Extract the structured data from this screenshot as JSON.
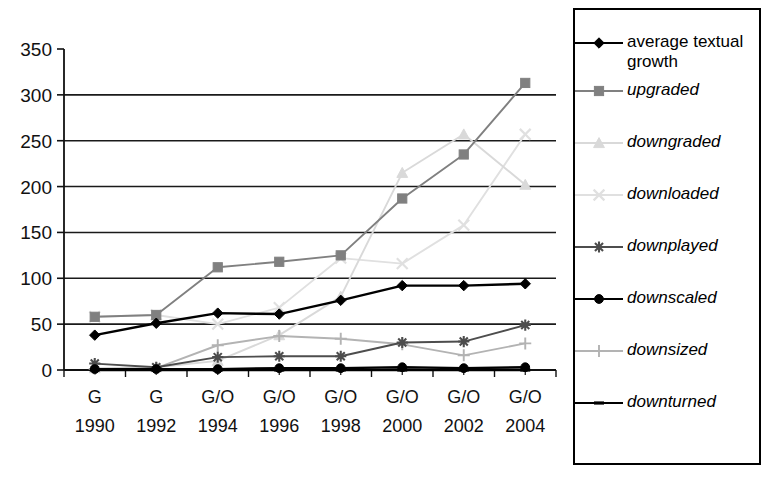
{
  "chart_data": {
    "type": "line",
    "title": "",
    "xlabel": "",
    "ylabel": "",
    "ylim": [
      0,
      350
    ],
    "ytick_step": 50,
    "yticks": [
      "0",
      "50",
      "100",
      "150",
      "200",
      "250",
      "300",
      "350"
    ],
    "grid": true,
    "legend_position": "right",
    "categories": [
      "1990",
      "1992",
      "1994",
      "1996",
      "1998",
      "2000",
      "2002",
      "2004"
    ],
    "category_prefixes": [
      "G",
      "G",
      "G/O",
      "G/O",
      "G/O",
      "G/O",
      "G/O",
      "G/O"
    ],
    "series": [
      {
        "name": "average textual growth",
        "marker": "diamond",
        "color": "#000000",
        "values": [
          38,
          51,
          62,
          61,
          76,
          92,
          92,
          94
        ]
      },
      {
        "name": "upgraded",
        "marker": "square",
        "color": "#808080",
        "values": [
          58,
          60,
          112,
          118,
          125,
          187,
          235,
          313
        ]
      },
      {
        "name": "downgraded",
        "marker": "triangle",
        "color": "#d9d9d9",
        "values": [
          2,
          3,
          10,
          38,
          80,
          215,
          257,
          202
        ]
      },
      {
        "name": "downloaded",
        "marker": "cross-x",
        "color": "#e0e0e0",
        "values": [
          58,
          60,
          50,
          68,
          122,
          116,
          158,
          257
        ]
      },
      {
        "name": "downplayed",
        "marker": "asterisk",
        "color": "#4d4d4d",
        "values": [
          7,
          3,
          14,
          15,
          15,
          30,
          31,
          49
        ]
      },
      {
        "name": "downscaled",
        "marker": "circle",
        "color": "#000000",
        "values": [
          1,
          1,
          1,
          2,
          2,
          3,
          2,
          3
        ]
      },
      {
        "name": "downsized",
        "marker": "plus",
        "color": "#b3b3b3",
        "values": [
          1,
          2,
          27,
          37,
          34,
          28,
          16,
          29
        ]
      },
      {
        "name": "downturned",
        "marker": "dash",
        "color": "#000000",
        "values": [
          0,
          0,
          0,
          0,
          0,
          0,
          0,
          0
        ]
      }
    ]
  },
  "legend": {
    "items": [
      {
        "label": "average textual growth",
        "italic": false,
        "marker": "diamond",
        "color": "#000000",
        "name": "legend-item-average-textual-growth"
      },
      {
        "label": "upgraded",
        "italic": true,
        "marker": "square",
        "color": "#808080",
        "name": "legend-item-upgraded"
      },
      {
        "label": "downgraded",
        "italic": true,
        "marker": "triangle",
        "color": "#d9d9d9",
        "name": "legend-item-downgraded"
      },
      {
        "label": "downloaded",
        "italic": true,
        "marker": "cross-x",
        "color": "#e0e0e0",
        "name": "legend-item-downloaded"
      },
      {
        "label": "downplayed",
        "italic": true,
        "marker": "asterisk",
        "color": "#4d4d4d",
        "name": "legend-item-downplayed"
      },
      {
        "label": "downscaled",
        "italic": true,
        "marker": "circle",
        "color": "#000000",
        "name": "legend-item-downscaled"
      },
      {
        "label": "downsized",
        "italic": true,
        "marker": "plus",
        "color": "#b3b3b3",
        "name": "legend-item-downsized"
      },
      {
        "label": "downturned",
        "italic": true,
        "marker": "dash",
        "color": "#000000",
        "name": "legend-item-downturned"
      }
    ]
  }
}
